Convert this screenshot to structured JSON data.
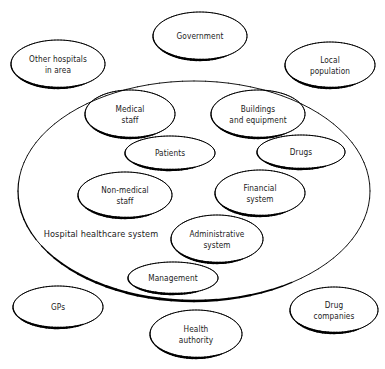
{
  "diagram": {
    "style": {
      "background": "#ffffff",
      "stroke": "#000000",
      "text_color": "#1a1a1a"
    },
    "boundary": {
      "label": "Hospital healthcare system",
      "label_x": 101,
      "label_y": 234,
      "cx": 194,
      "cy": 191,
      "rx": 176,
      "ry": 110
    },
    "nodes": [
      {
        "id": "government",
        "label": "Government",
        "cx": 200,
        "cy": 36,
        "rx": 47,
        "ry": 24
      },
      {
        "id": "other-hospitals",
        "label": "Other hospitals\nin area",
        "cx": 58,
        "cy": 64,
        "rx": 47,
        "ry": 24
      },
      {
        "id": "local-population",
        "label": "Local\npopulation",
        "cx": 330,
        "cy": 65,
        "rx": 45,
        "ry": 23
      },
      {
        "id": "medical-staff",
        "label": "Medical\nstaff",
        "cx": 130,
        "cy": 114,
        "rx": 45,
        "ry": 24
      },
      {
        "id": "buildings-equipment",
        "label": "Buildings\nand equipment",
        "cx": 258,
        "cy": 114,
        "rx": 47,
        "ry": 24
      },
      {
        "id": "patients",
        "label": "Patients",
        "cx": 170,
        "cy": 153,
        "rx": 45,
        "ry": 17
      },
      {
        "id": "drugs",
        "label": "Drugs",
        "cx": 301,
        "cy": 152,
        "rx": 44,
        "ry": 17
      },
      {
        "id": "non-medical-staff",
        "label": "Non-medical\nstaff",
        "cx": 125,
        "cy": 195,
        "rx": 47,
        "ry": 23
      },
      {
        "id": "financial-system",
        "label": "Financial\nsystem",
        "cx": 260,
        "cy": 193,
        "rx": 45,
        "ry": 23
      },
      {
        "id": "administrative-system",
        "label": "Administrative\nsystem",
        "cx": 217,
        "cy": 239,
        "rx": 46,
        "ry": 24
      },
      {
        "id": "management",
        "label": "Management",
        "cx": 173,
        "cy": 278,
        "rx": 45,
        "ry": 16
      },
      {
        "id": "gps",
        "label": "GPs",
        "cx": 58,
        "cy": 307,
        "rx": 45,
        "ry": 21
      },
      {
        "id": "health-authority",
        "label": "Health\nauthority",
        "cx": 196,
        "cy": 334,
        "rx": 46,
        "ry": 24
      },
      {
        "id": "drug-companies",
        "label": "Drug\ncompanies",
        "cx": 334,
        "cy": 310,
        "rx": 44,
        "ry": 23
      }
    ]
  }
}
